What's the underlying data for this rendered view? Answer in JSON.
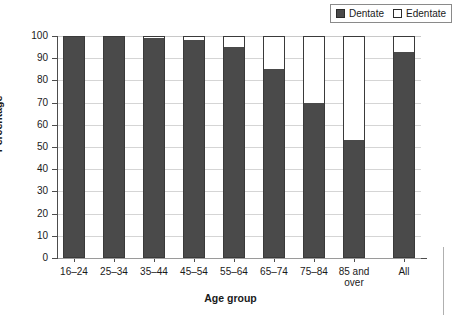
{
  "legend": {
    "entries": [
      {
        "label": "Dentate",
        "swatch": "filled",
        "color": "#4a4a4a"
      },
      {
        "label": "Edentate",
        "swatch": "empty",
        "color": "#ffffff"
      }
    ]
  },
  "axes": {
    "y_title": "Percentage",
    "x_title": "Age group",
    "y_ticks": [
      "100",
      "90",
      "80",
      "70",
      "60",
      "50",
      "40",
      "30",
      "20",
      "10",
      "0"
    ]
  },
  "chart_data": {
    "type": "bar",
    "title": "",
    "xlabel": "Age group",
    "ylabel": "Percentage",
    "ylim": [
      0,
      100
    ],
    "grid": true,
    "stacked": true,
    "legend_position": "top-right",
    "categories": [
      "16–24",
      "25–34",
      "35–44",
      "45–54",
      "55–64",
      "65–74",
      "75–84",
      "85 and over",
      "All"
    ],
    "category_labels_display": [
      "16–24",
      "25–34",
      "35–44",
      "45–54",
      "55–64",
      "65–74",
      "75–84",
      "85 and<br>over",
      "All"
    ],
    "series": [
      {
        "name": "Dentate",
        "color": "#4a4a4a",
        "values": [
          100,
          100,
          99,
          98,
          95,
          85,
          70,
          53,
          93
        ]
      },
      {
        "name": "Edentate",
        "color": "#ffffff",
        "values": [
          0,
          0,
          1,
          2,
          5,
          15,
          30,
          47,
          7
        ]
      }
    ]
  }
}
